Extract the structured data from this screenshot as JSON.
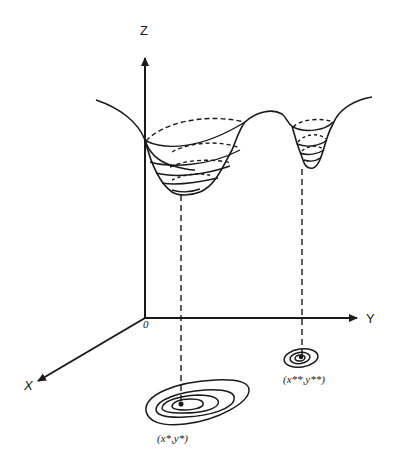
{
  "diagram": {
    "type": "3d-surface-with-two-local-minima-and-contour-projections",
    "axes": {
      "z_label": "Z",
      "y_label": "Y",
      "x_label": "X",
      "origin_label": "0"
    },
    "minima": [
      {
        "name": "global-minimum",
        "label": "(x*,y*)",
        "contour_rings": 4
      },
      {
        "name": "local-minimum",
        "label": "(x**,y**)",
        "contour_rings": 3
      }
    ],
    "colors": {
      "ink": "#1a1a1a",
      "background": "#ffffff"
    }
  }
}
